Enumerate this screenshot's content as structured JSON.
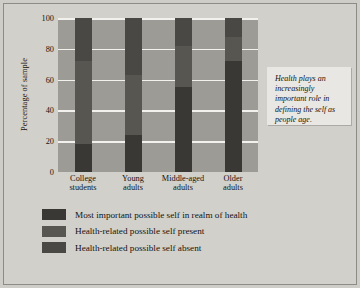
{
  "pullquote": {
    "text": "Health plays an increasingly important role in defining the self as people age."
  },
  "colors": {
    "plot_background": "#9d9b96",
    "gridline": "#f2f1ee",
    "page_background": "#d2d0cb",
    "seg_most_important": "#3a3835",
    "seg_present": "#585651",
    "seg_absent": "#4a4844"
  },
  "legend": {
    "items": [
      {
        "label": "Most important possible self in realm of health",
        "color": "#3a3835"
      },
      {
        "label": "Health-related possible self present",
        "color": "#585651"
      },
      {
        "label": "Health-related possible self absent",
        "color": "#4a4844"
      }
    ]
  },
  "chart_data": {
    "type": "bar",
    "subtype": "stacked-bar",
    "title": "",
    "xlabel": "",
    "ylabel": "Percentage of sample",
    "ylim": [
      0,
      100
    ],
    "yticks": [
      100,
      80,
      60,
      40,
      20,
      0
    ],
    "ytick_labels": [
      "100",
      "80",
      "60",
      "40",
      "20",
      "0"
    ],
    "grid": true,
    "grid_axis": "y",
    "legend_position": "below",
    "categories": [
      "College students",
      "Young adults",
      "Middle-aged adults",
      "Older adults"
    ],
    "category_lines": [
      [
        "College",
        "students"
      ],
      [
        "Young",
        "adults"
      ],
      [
        "Middle-aged",
        "adults"
      ],
      [
        "Older",
        "adults"
      ]
    ],
    "series": [
      {
        "name": "Most important possible self in realm of health",
        "color": "#3a3835",
        "values": [
          18,
          24,
          55,
          72
        ]
      },
      {
        "name": "Health-related possible self present",
        "color": "#585651",
        "values": [
          54,
          39,
          27,
          16
        ]
      },
      {
        "name": "Health-related possible self absent",
        "color": "#4a4844",
        "values": [
          28,
          37,
          18,
          12
        ]
      }
    ],
    "stack_order": "bottom-to-top",
    "units": "percent"
  }
}
